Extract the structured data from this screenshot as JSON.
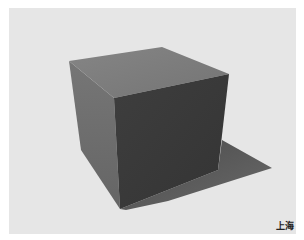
{
  "image": {
    "subject": "cube-with-cast-shadow",
    "caption": "上海",
    "colors": {
      "background": "#e6e6e6",
      "border": "#ffffff",
      "top_face": "#7f7f7f",
      "left_face": "#6e6e6e",
      "front_face": "#3a3a3a",
      "shadow": "#555555",
      "caption": "#222222"
    }
  }
}
